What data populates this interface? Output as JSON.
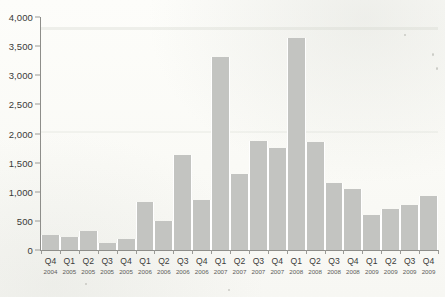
{
  "chart_data": {
    "type": "bar",
    "title": "",
    "subtitle": "",
    "xlabel": "",
    "ylabel": "",
    "ylim": [
      0,
      4000
    ],
    "ytick_step": 500,
    "grid": false,
    "legend": null,
    "bar_color": "#c3c4c1",
    "axis_color": "#8e8e8a",
    "background_color": "#fbfbf8",
    "yticks": [
      "0",
      "500",
      "1,000",
      "1,500",
      "2,000",
      "2,500",
      "3,000",
      "3,500",
      "4,000"
    ],
    "ytick_values": [
      0,
      500,
      1000,
      1500,
      2000,
      2500,
      3000,
      3500,
      4000
    ],
    "categories": [
      "Q4 2004",
      "Q1 2005",
      "Q2 2005",
      "Q3 2005",
      "Q4 2005",
      "Q1 2006",
      "Q2 2006",
      "Q3 2006",
      "Q4 2006",
      "Q1 2007",
      "Q2 2007",
      "Q3 2007",
      "Q4 2007",
      "Q1 2008",
      "Q2 2008",
      "Q3 2008",
      "Q4 2008",
      "Q1 2009",
      "Q2 2009",
      "Q3 2009",
      "Q4 2009"
    ],
    "quarter_labels": [
      "Q4",
      "Q1",
      "Q2",
      "Q3",
      "Q4",
      "Q1",
      "Q2",
      "Q3",
      "Q4",
      "Q1",
      "Q2",
      "Q3",
      "Q4",
      "Q1",
      "Q2",
      "Q3",
      "Q4",
      "Q1",
      "Q2",
      "Q3",
      "Q4"
    ],
    "year_labels": [
      "2004",
      "2005",
      "2005",
      "2005",
      "2005",
      "2006",
      "2006",
      "2006",
      "2006",
      "2007",
      "2007",
      "2007",
      "2007",
      "2008",
      "2008",
      "2008",
      "2008",
      "2009",
      "2009",
      "2009",
      "2009"
    ],
    "values": [
      255,
      215,
      325,
      115,
      195,
      830,
      495,
      1630,
      860,
      3320,
      1300,
      1880,
      1745,
      3640,
      1855,
      1150,
      1040,
      605,
      710,
      775,
      920
    ]
  }
}
